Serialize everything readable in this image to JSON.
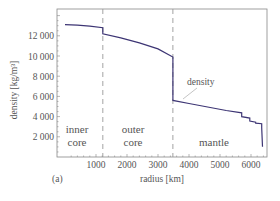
{
  "chart_data": {
    "type": "line",
    "title": "",
    "panel_label": "(a)",
    "xlabel": "radius [km]",
    "ylabel": "density [kg/m³]",
    "xlim": [
      0,
      6600
    ],
    "ylim": [
      0,
      14000
    ],
    "x_ticks": [
      1000,
      2000,
      3000,
      4000,
      5000,
      6000
    ],
    "x_tick_labels": [
      "1000",
      "2000",
      "3000",
      "4000",
      "5000",
      "6000"
    ],
    "y_ticks": [
      2000,
      4000,
      6000,
      8000,
      10000,
      12000
    ],
    "y_tick_labels": [
      "2 000",
      "4 000",
      "6 000",
      "8 000",
      "10 000",
      "12 000"
    ],
    "grid": false,
    "series": [
      {
        "name": "density",
        "color": "#3d3574",
        "x": [
          0,
          400,
          800,
          1220,
          1220,
          1800,
          2400,
          3000,
          3480,
          3480,
          4000,
          4600,
          5200,
          5700,
          5701,
          5960,
          5961,
          6150,
          6151,
          6346,
          6346,
          6371
        ],
        "y": [
          13100,
          13050,
          12950,
          12800,
          12200,
          11800,
          11300,
          10700,
          9900,
          5600,
          5300,
          4950,
          4600,
          4380,
          3990,
          3850,
          3550,
          3450,
          3360,
          3300,
          2900,
          1020
        ]
      }
    ],
    "boundaries": [
      {
        "x": 1220,
        "style": "dashed"
      },
      {
        "x": 3480,
        "style": "dashed"
      }
    ],
    "annotations": [
      {
        "text": "density",
        "x": 4400,
        "y": 7300,
        "pointer_to": [
          3900,
          5400
        ]
      },
      {
        "text": "inner\ncore",
        "x": 600,
        "y": 2200
      },
      {
        "text": "outer\ncore",
        "x": 2350,
        "y": 2200
      },
      {
        "text": "mantle",
        "x": 4950,
        "y": 1600
      }
    ],
    "region_labels": {
      "inner": [
        "inner",
        "core"
      ],
      "outer": [
        "outer",
        "core"
      ],
      "mantle": "mantle"
    }
  }
}
